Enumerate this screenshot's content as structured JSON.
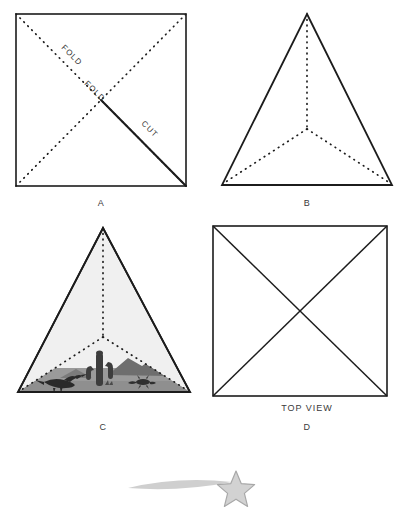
{
  "figure": {
    "background_color": "#ffffff",
    "ink_color": "#1c1c1c",
    "label_color": "#3a3a3a"
  },
  "panels": [
    {
      "id": "A",
      "label": "A",
      "shape": "square",
      "description": "Square sheet with both diagonals shown as dotted fold lines and one half-diagonal drawn as a solid cut line",
      "geometry": {
        "x": 16,
        "y": 14,
        "width": 170,
        "height": 172
      },
      "label_position": {
        "x": 101,
        "y": 203
      },
      "annotations": [
        {
          "name": "fold-label-upper",
          "text": "FOLD",
          "x": 70,
          "y": 57,
          "rotation": 45
        },
        {
          "name": "fold-label-lower",
          "text": "FOLD",
          "x": 92,
          "y": 92,
          "rotation": 45
        },
        {
          "name": "cut-label",
          "text": "CUT",
          "x": 144,
          "y": 130,
          "rotation": 45
        }
      ],
      "lines": [
        {
          "name": "fold-diagonal-tl-br",
          "style": "dotted"
        },
        {
          "name": "fold-diagonal-bl-tr",
          "style": "dotted"
        },
        {
          "name": "cut-line-center-to-br",
          "style": "solid"
        }
      ]
    },
    {
      "id": "B",
      "label": "B",
      "shape": "triangle",
      "description": "Folded pyramid net seen as a triangle, with dotted interior fold lines meeting at a centroid",
      "geometry": {
        "apex_x": 307,
        "apex_y": 14,
        "base_left_x": 222,
        "base_right_x": 392,
        "base_y": 185
      },
      "centroid": {
        "x": 307,
        "y": 129
      },
      "label_position": {
        "x": 307,
        "y": 203
      },
      "lines": [
        {
          "name": "fold-apex-to-centroid",
          "style": "dotted"
        },
        {
          "name": "fold-centroid-to-base-left",
          "style": "dotted"
        },
        {
          "name": "fold-centroid-to-base-right",
          "style": "dotted"
        }
      ]
    },
    {
      "id": "C",
      "label": "C",
      "shape": "triangle",
      "description": "Assembled pyramid diorama with a shaded face and a desert scene along the base: saguaro cactus, mountain range, roadrunner and lizard",
      "geometry": {
        "apex_x": 103,
        "apex_y": 228,
        "base_left_x": 18,
        "base_right_x": 190,
        "base_y": 392
      },
      "centroid": {
        "x": 103,
        "y": 337
      },
      "fill_color": "#f0f0f0",
      "ground_color": "#9a9a9a",
      "label_position": {
        "x": 103,
        "y": 427
      },
      "scene_items": [
        {
          "name": "cactus",
          "label": "saguaro cactus"
        },
        {
          "name": "mountain",
          "label": "mountain range"
        },
        {
          "name": "roadrunner",
          "label": "roadrunner bird"
        },
        {
          "name": "lizard",
          "label": "lizard"
        },
        {
          "name": "ground",
          "label": "desert ground"
        }
      ]
    },
    {
      "id": "D",
      "label": "D",
      "shape": "square",
      "description": "Top view of the finished pyramid: a square with both diagonals drawn solid",
      "geometry": {
        "x": 213,
        "y": 226,
        "width": 174,
        "height": 170
      },
      "caption": "TOP VIEW",
      "caption_position": {
        "x": 307,
        "y": 408
      },
      "label_position": {
        "x": 307,
        "y": 427
      },
      "lines": [
        {
          "name": "edge-diagonal-tl-br",
          "style": "solid"
        },
        {
          "name": "edge-diagonal-bl-tr",
          "style": "solid"
        }
      ]
    }
  ],
  "decoration": {
    "name": "shooting-star",
    "description": "Gray five-pointed star with a tapering comet trail sweeping in from the left",
    "star_center": {
      "x": 236,
      "y": 489
    },
    "star_radius": 17,
    "trail_start_x": 128,
    "trail_end_x": 230,
    "fill_color": "#d2d2d2",
    "stroke_color": "#a8a8a8",
    "trail_color": "#cfcfcf"
  }
}
